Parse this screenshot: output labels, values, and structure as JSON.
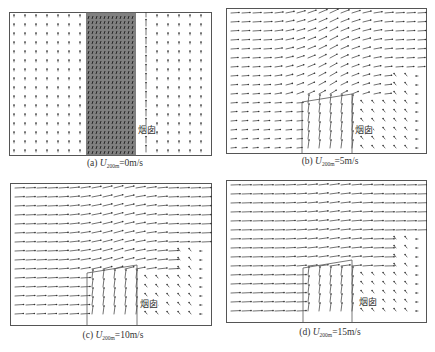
{
  "figure": {
    "panels": [
      {
        "id": "a",
        "letter": "(a)",
        "var": "U",
        "sub": "200m",
        "eq": "=0m/s",
        "chimney_label": "烟囱",
        "wind_speed": 0
      },
      {
        "id": "b",
        "letter": "(b)",
        "var": "U",
        "sub": "200m",
        "eq": "=5m/s",
        "chimney_label": "烟囱",
        "wind_speed": 5
      },
      {
        "id": "c",
        "letter": "(c)",
        "var": "U",
        "sub": "200m",
        "eq": "=10m/s",
        "chimney_label": "烟囱",
        "wind_speed": 10
      },
      {
        "id": "d",
        "letter": "(d)",
        "var": "U",
        "sub": "200m",
        "eq": "=15m/s",
        "chimney_label": "烟囱",
        "wind_speed": 15
      }
    ],
    "colors": {
      "frame": "#555555",
      "vector": "#333333",
      "plume": "#6a6a6a"
    }
  }
}
